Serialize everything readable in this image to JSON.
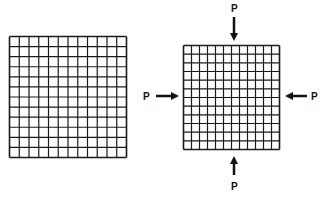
{
  "diagram": {
    "grids": [
      {
        "name": "undeformed-mesh",
        "columns": 12,
        "rows": 12
      },
      {
        "name": "compressed-mesh",
        "columns": 12,
        "rows": 12
      }
    ],
    "loads": [
      {
        "name": "load-top",
        "label": "P",
        "direction": "down"
      },
      {
        "name": "load-bottom",
        "label": "P",
        "direction": "up"
      },
      {
        "name": "load-left",
        "label": "P",
        "direction": "right"
      },
      {
        "name": "load-right",
        "label": "P",
        "direction": "left"
      }
    ],
    "line_color": "#1a1a1a"
  }
}
